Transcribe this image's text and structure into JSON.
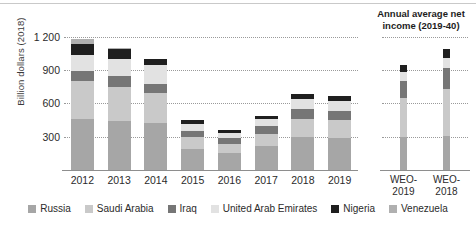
{
  "axis": {
    "y_title": "Billion dollars (2018)",
    "y_ticks": [
      "1 200",
      "900",
      "600",
      "300"
    ],
    "y_tick_values": [
      1200,
      900,
      600,
      300
    ],
    "y_max": 1260,
    "y_min": 0
  },
  "right_panel": {
    "title_line1": "Annual average net",
    "title_line2": "income (2019-40)",
    "labels": [
      {
        "line1": "WEO-",
        "line2": "2019"
      },
      {
        "line1": "WEO-",
        "line2": "2018"
      }
    ]
  },
  "legend": {
    "items": [
      {
        "label": "Russia",
        "color": "#a6a6a6"
      },
      {
        "label": "Saudi Arabia",
        "color": "#c9c9c9"
      },
      {
        "label": "Iraq",
        "color": "#767676"
      },
      {
        "label": "United Arab Emirates",
        "color": "#e2e2e2"
      },
      {
        "label": "Nigeria",
        "color": "#1f1f1f"
      },
      {
        "label": "Venezuela",
        "color": "#b0b0b0"
      }
    ]
  },
  "chart_data": {
    "type": "bar",
    "subtype": "stacked",
    "title": "",
    "xlabel": "",
    "ylabel": "Billion dollars (2018)",
    "ylim": [
      0,
      1260
    ],
    "grid": true,
    "gridlines": [
      300,
      600,
      900,
      1200
    ],
    "legend_position": "bottom",
    "categories": [
      "2012",
      "2013",
      "2014",
      "2015",
      "2016",
      "2017",
      "2018",
      "2019"
    ],
    "series": [
      {
        "name": "Russia",
        "color": "#a6a6a6",
        "values": [
          460,
          440,
          425,
          190,
          155,
          215,
          300,
          290
        ]
      },
      {
        "name": "Saudi Arabia",
        "color": "#c9c9c9",
        "values": [
          340,
          310,
          265,
          105,
          75,
          110,
          160,
          160
        ]
      },
      {
        "name": "Iraq",
        "color": "#767676",
        "values": [
          90,
          100,
          85,
          60,
          55,
          70,
          90,
          85
        ]
      },
      {
        "name": "United Arab Emirates",
        "color": "#e2e2e2",
        "values": [
          145,
          150,
          170,
          60,
          50,
          65,
          85,
          85
        ]
      },
      {
        "name": "Nigeria",
        "color": "#1f1f1f",
        "values": [
          95,
          85,
          55,
          35,
          25,
          30,
          45,
          45
        ]
      },
      {
        "name": "Venezuela",
        "color": "#b0b0b0",
        "values": [
          50,
          15,
          0,
          0,
          0,
          0,
          0,
          0
        ]
      }
    ],
    "totals": [
      1180,
      1100,
      1000,
      450,
      360,
      490,
      680,
      665
    ],
    "secondary_panel": {
      "title": "Annual average net income (2019-40)",
      "categories": [
        "WEO-2019",
        "WEO-2018"
      ],
      "series": [
        {
          "name": "Russia",
          "color": "#a6a6a6",
          "values": [
            300,
            310
          ]
        },
        {
          "name": "Saudi Arabia",
          "color": "#c9c9c9",
          "values": [
            345,
            420
          ]
        },
        {
          "name": "Iraq",
          "color": "#767676",
          "values": [
            160,
            190
          ]
        },
        {
          "name": "United Arab Emirates",
          "color": "#e2e2e2",
          "values": [
            80,
            90
          ]
        },
        {
          "name": "Nigeria",
          "color": "#1f1f1f",
          "values": [
            60,
            80
          ]
        },
        {
          "name": "Venezuela",
          "color": "#b0b0b0",
          "values": [
            0,
            0
          ]
        }
      ],
      "totals": [
        945,
        1090
      ]
    }
  }
}
